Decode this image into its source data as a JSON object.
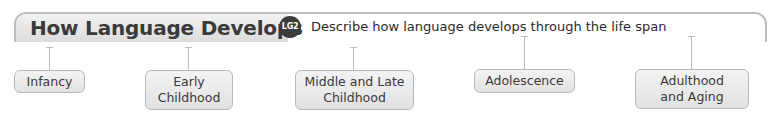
{
  "header": {
    "title": "How Language Develops",
    "badge": "LG2",
    "description": "Describe how language develops through the life span"
  },
  "nodes": [
    {
      "label": "Infancy"
    },
    {
      "label": "Early Childhood"
    },
    {
      "label": "Middle and Late Childhood"
    },
    {
      "label": "Adolescence"
    },
    {
      "label": "Adulthood and Aging"
    }
  ],
  "colors": {
    "title_text": "#3a3a3a",
    "badge_bg": "#3c3c3c",
    "frame_line": "#bdbdbd",
    "node_bg": "#e8e8e8"
  }
}
